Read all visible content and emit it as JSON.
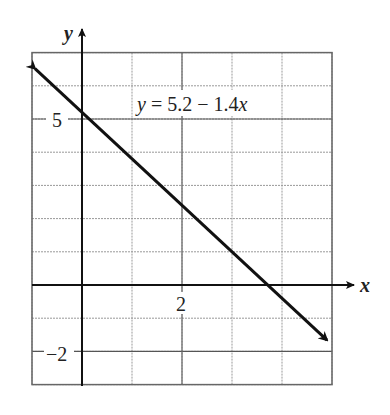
{
  "chart_data": {
    "type": "line",
    "title": "",
    "xlabel": "x",
    "ylabel": "y",
    "xlim": [
      -1,
      5
    ],
    "ylim": [
      -3,
      7
    ],
    "grid": true,
    "x_tick_labels": [
      {
        "value": 2,
        "label": "2"
      }
    ],
    "y_tick_labels": [
      {
        "value": 5,
        "label": "5"
      },
      {
        "value": -2,
        "label": "−2"
      }
    ],
    "series": [
      {
        "name": "y = 5.2 − 1.4x",
        "equation": {
          "intercept": 5.2,
          "slope": -1.4
        },
        "x": [
          -1,
          0,
          1,
          2,
          3,
          4,
          5
        ],
        "values": [
          6.6,
          5.2,
          3.8,
          2.4,
          1.0,
          -0.4,
          -1.8
        ],
        "arrows_both_ends": true
      }
    ],
    "annotations": [
      {
        "text": "y = 5.2 − 1.4x",
        "x": 2.3,
        "y": 5.5
      }
    ]
  },
  "labels": {
    "x_axis": "x",
    "y_axis": "y",
    "equation_y": "y",
    "equation_rest": " = 5.2 − 1.4",
    "equation_x": "x",
    "tick_x_2": "2",
    "tick_y_5": "5",
    "tick_y_neg2": "−2"
  },
  "colors": {
    "line": "#111111",
    "axis": "#111111",
    "grid_major": "#666666",
    "grid_minor": "#aaaaaa"
  }
}
